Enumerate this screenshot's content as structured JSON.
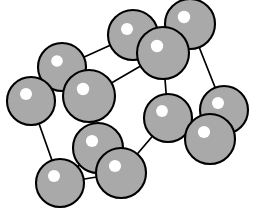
{
  "figure": {
    "type": "ball-and-stick-lattice-diagram",
    "width": 259,
    "height": 216,
    "background_color": "#ffffff"
  },
  "style": {
    "atom_fill": "#a9a9a9",
    "atom_stroke": "#000000",
    "atom_stroke_width": 2.1,
    "highlight_fill": "#ffffff",
    "bond_stroke": "#000000",
    "bond_stroke_width": 1.7
  },
  "atoms": [
    {
      "id": "a1",
      "label": "back-top-left",
      "cx": 133,
      "cy": 35,
      "r": 25,
      "hx": 127,
      "hy": 29,
      "hr": 6.0,
      "z": 1
    },
    {
      "id": "a2",
      "label": "back-top-right",
      "cx": 190,
      "cy": 24,
      "r": 25,
      "hx": 184,
      "hy": 17,
      "hr": 6.2,
      "z": 2
    },
    {
      "id": "a3",
      "label": "front-top-center",
      "cx": 163,
      "cy": 53,
      "r": 26,
      "hx": 157,
      "hy": 46,
      "hr": 6.2,
      "z": 3
    },
    {
      "id": "a4",
      "label": "back-top-far-left",
      "cx": 62,
      "cy": 67,
      "r": 24,
      "hx": 57,
      "hy": 61,
      "hr": 5.8,
      "z": 1
    },
    {
      "id": "a5",
      "label": "front-top-left",
      "cx": 89,
      "cy": 96,
      "r": 26,
      "hx": 83,
      "hy": 89,
      "hr": 6.2,
      "z": 3
    },
    {
      "id": "a6",
      "label": "left-outer-top",
      "cx": 31,
      "cy": 101,
      "r": 24,
      "hx": 26,
      "hy": 94,
      "hr": 6.0,
      "z": 2
    },
    {
      "id": "a7",
      "label": "right-middle",
      "cx": 168,
      "cy": 118,
      "r": 24,
      "hx": 162,
      "hy": 111,
      "hr": 5.9,
      "z": 3
    },
    {
      "id": "a8",
      "label": "right-outer-top",
      "cx": 224,
      "cy": 110,
      "r": 24,
      "hx": 218,
      "hy": 103,
      "hr": 6.0,
      "z": 1
    },
    {
      "id": "a9",
      "label": "right-outer-front",
      "cx": 210,
      "cy": 139,
      "r": 25,
      "hx": 204,
      "hy": 132,
      "hr": 6.1,
      "z": 4
    },
    {
      "id": "a10",
      "label": "front-bottom-left",
      "cx": 98,
      "cy": 148,
      "r": 25,
      "hx": 92,
      "hy": 141,
      "hr": 6.1,
      "z": 3
    },
    {
      "id": "a11",
      "label": "bottom-center",
      "cx": 121,
      "cy": 173,
      "r": 25,
      "hx": 115,
      "hy": 166,
      "hr": 6.1,
      "z": 4
    },
    {
      "id": "a12",
      "label": "bottom-left-outer",
      "cx": 60,
      "cy": 183,
      "r": 24,
      "hx": 54,
      "hy": 176,
      "hr": 6.0,
      "z": 2
    }
  ],
  "bonds": [
    {
      "id": "b1",
      "label": "back-top-left-to-back-top-right",
      "x1": 133,
      "y1": 35,
      "x2": 190,
      "y2": 24
    },
    {
      "id": "b2",
      "label": "back-top-left-to-back-top-far-left",
      "x1": 133,
      "y1": 35,
      "x2": 62,
      "y2": 67
    },
    {
      "id": "b3",
      "label": "back-top-left-to-front-top-center",
      "x1": 133,
      "y1": 35,
      "x2": 163,
      "y2": 53
    },
    {
      "id": "b4",
      "label": "back-top-right-to-right-outer-top",
      "x1": 190,
      "y1": 24,
      "x2": 224,
      "y2": 110
    },
    {
      "id": "b5",
      "label": "front-top-center-to-right-middle",
      "x1": 163,
      "y1": 53,
      "x2": 168,
      "y2": 118
    },
    {
      "id": "b6",
      "label": "back-top-far-left-to-front-top-left",
      "x1": 62,
      "y1": 67,
      "x2": 89,
      "y2": 96
    },
    {
      "id": "b7",
      "label": "back-top-far-left-to-left-outer",
      "x1": 62,
      "y1": 67,
      "x2": 31,
      "y2": 101
    },
    {
      "id": "b8",
      "label": "front-top-left-to-front-top-center",
      "x1": 89,
      "y1": 96,
      "x2": 163,
      "y2": 53
    },
    {
      "id": "b9",
      "label": "front-top-left-to-front-bottom-left",
      "x1": 89,
      "y1": 96,
      "x2": 98,
      "y2": 148
    },
    {
      "id": "b10",
      "label": "left-outer-to-bottom-left-outer",
      "x1": 31,
      "y1": 101,
      "x2": 60,
      "y2": 183
    },
    {
      "id": "b11",
      "label": "right-middle-to-right-outer-front",
      "x1": 168,
      "y1": 118,
      "x2": 210,
      "y2": 139
    },
    {
      "id": "b12",
      "label": "right-middle-to-bottom-center",
      "x1": 168,
      "y1": 118,
      "x2": 121,
      "y2": 173
    },
    {
      "id": "b13",
      "label": "right-outer-top-to-right-outer-front",
      "x1": 224,
      "y1": 110,
      "x2": 210,
      "y2": 139
    },
    {
      "id": "b14",
      "label": "front-bottom-left-to-bottom-center",
      "x1": 98,
      "y1": 148,
      "x2": 121,
      "y2": 173
    },
    {
      "id": "b15",
      "label": "front-bottom-left-to-bottom-left-outer",
      "x1": 98,
      "y1": 148,
      "x2": 60,
      "y2": 183
    },
    {
      "id": "b16",
      "label": "bottom-center-to-bottom-left-outer",
      "x1": 121,
      "y1": 173,
      "x2": 60,
      "y2": 183
    }
  ]
}
